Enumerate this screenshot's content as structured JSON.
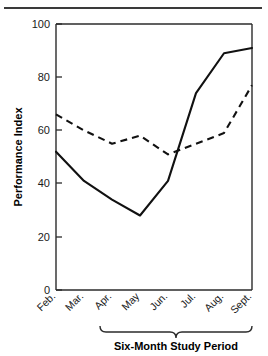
{
  "figure": {
    "top_rule": "horizontal-rule",
    "background": "#ffffff",
    "ink_color": "#111111"
  },
  "chart_data": {
    "type": "line",
    "title": "",
    "xlabel": "Six-Month Study Period",
    "ylabel": "Performance Index",
    "categories": [
      "Feb.",
      "Mar.",
      "Apr.",
      "May",
      "Jun.",
      "Jul.",
      "Aug.",
      "Sept."
    ],
    "series": [
      {
        "name": "solid-series",
        "style": "solid",
        "color": "#111111",
        "values": [
          52,
          41,
          34,
          28,
          41,
          74,
          89,
          91
        ]
      },
      {
        "name": "dashed-series",
        "style": "dashed",
        "color": "#111111",
        "values": [
          66,
          60,
          55,
          58,
          51,
          55,
          59,
          77
        ]
      }
    ],
    "ylim": [
      0,
      100
    ],
    "yticks": [
      0,
      20,
      40,
      60,
      80,
      100
    ],
    "ytick_labels": [
      "0",
      "20",
      "40",
      "60",
      "80",
      "100"
    ],
    "grid": false,
    "legend": "none",
    "annotations": [
      {
        "name": "study-period-brace",
        "text": "Six-Month Study Period",
        "spans": [
          "Apr.",
          "Sept."
        ]
      }
    ]
  }
}
